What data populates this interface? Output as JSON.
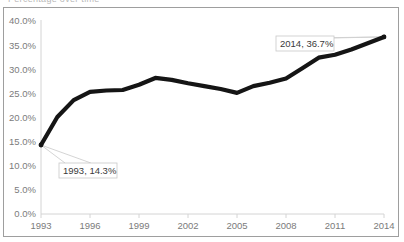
{
  "frame": {
    "clipped_title": "Percentage over time",
    "border_color": "#9e9e9e",
    "background_color": "#ffffff"
  },
  "chart_data": {
    "type": "line",
    "title": "",
    "xlabel": "",
    "ylabel": "",
    "xlim": [
      1993,
      2014
    ],
    "ylim": [
      0,
      40
    ],
    "ytick_labels": [
      "40.0%",
      "35.0%",
      "30.0%",
      "25.0%",
      "20.0%",
      "15.0%",
      "10.0%",
      "5.0%",
      "0.0%"
    ],
    "ytick_values": [
      40,
      35,
      30,
      25,
      20,
      15,
      10,
      5,
      0
    ],
    "xtick_labels": [
      "1993",
      "1996",
      "1999",
      "2002",
      "2005",
      "2008",
      "2011",
      "2014"
    ],
    "xtick_values": [
      1993,
      1996,
      1999,
      2002,
      2005,
      2008,
      2011,
      2014
    ],
    "grid": false,
    "legend": false,
    "line_color": "#151515",
    "x": [
      1993,
      1994,
      1995,
      1996,
      1997,
      1998,
      1999,
      2000,
      2001,
      2002,
      2003,
      2004,
      2005,
      2006,
      2007,
      2008,
      2009,
      2010,
      2011,
      2012,
      2013,
      2014
    ],
    "values": [
      14.3,
      20.1,
      23.6,
      25.3,
      25.6,
      25.7,
      26.8,
      28.2,
      27.8,
      27.1,
      26.5,
      25.9,
      25.1,
      26.5,
      27.2,
      28.1,
      30.2,
      32.4,
      33.0,
      34.1,
      35.4,
      36.7
    ],
    "series": [
      {
        "name": "",
        "values": [
          14.3,
          20.1,
          23.6,
          25.3,
          25.6,
          25.7,
          26.8,
          28.2,
          27.8,
          27.1,
          26.5,
          25.9,
          25.1,
          26.5,
          27.2,
          28.1,
          30.2,
          32.4,
          33.0,
          34.1,
          35.4,
          36.7
        ]
      }
    ],
    "annotations": [
      {
        "label": "1993, 14.3%",
        "x": 1993,
        "y": 14.3
      },
      {
        "label": "2014, 36.7%",
        "x": 2014,
        "y": 36.7
      }
    ]
  }
}
